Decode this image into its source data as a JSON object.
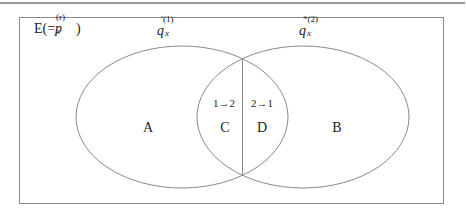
{
  "diagram": {
    "type": "venn",
    "universe_label": {
      "prefix": "E(=",
      "var": "p",
      "sub": "x",
      "sup": "(r)",
      "suffix": ")"
    },
    "set_left": {
      "var": "q",
      "sub": "x",
      "sup": "′(1)"
    },
    "set_right": {
      "var": "q",
      "sub": "x",
      "sup": "*(2)"
    },
    "regions": {
      "A": "A",
      "B": "B",
      "C": "C",
      "D": "D"
    },
    "transitions": {
      "c": "1→2",
      "d": "2→1"
    },
    "colors": {
      "line": "#8a8a8a",
      "top_rule": "#9a9a9a",
      "text": "#222222"
    }
  }
}
